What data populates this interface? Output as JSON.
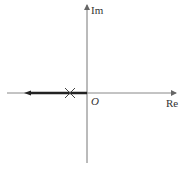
{
  "diagram": {
    "type": "root-locus",
    "axes": {
      "real_label": "Re",
      "imag_label": "Im",
      "origin_label": "O"
    },
    "poles": [
      {
        "marker": "x",
        "position": "negative-real-axis"
      }
    ],
    "locus": {
      "direction": "toward negative infinity along real axis",
      "arrow": "left"
    },
    "colors": {
      "axis": "#777777",
      "locus": "#222222",
      "text": "#333333"
    }
  }
}
